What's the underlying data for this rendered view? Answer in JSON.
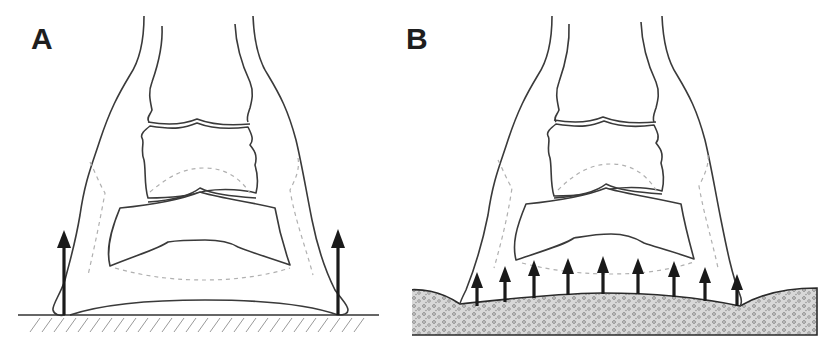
{
  "figure": {
    "panels": [
      {
        "label": "A",
        "description": "Hoof on hard flat ground; load concentrated at hoof wall",
        "ground": "hard-hatched",
        "arrow_count": 2
      },
      {
        "label": "B",
        "description": "Hoof on compliant/deformable ground; load distributed across sole",
        "ground": "soft-stippled",
        "arrow_count": 9
      }
    ],
    "colors": {
      "line": "#3a3a3a",
      "arrow": "#1a1a1a",
      "dashed_outline": "#b0b0b0",
      "hatch": "#9a9a9a",
      "ground_fill": "#d4d4d4"
    }
  }
}
